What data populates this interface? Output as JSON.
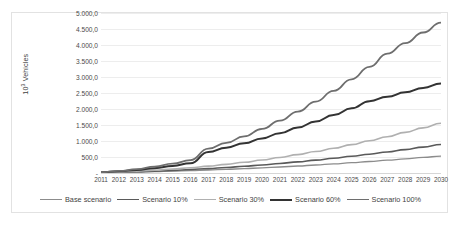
{
  "chart_data": {
    "type": "line",
    "title": "",
    "xlabel": "",
    "ylabel": "10³ Vehicles",
    "ylabel_html": "10<sup>3</sup> Vehicles",
    "x": [
      2011,
      2012,
      2013,
      2014,
      2015,
      2016,
      2017,
      2018,
      2019,
      2020,
      2021,
      2022,
      2023,
      2024,
      2025,
      2026,
      2027,
      2028,
      2029,
      2030
    ],
    "categories": [
      "2011",
      "2012",
      "2013",
      "2014",
      "2015",
      "2016",
      "2017",
      "2018",
      "2019",
      "2020",
      "2021",
      "2022",
      "2023",
      "2024",
      "2025",
      "2026",
      "2027",
      "2028",
      "2029",
      "2030"
    ],
    "ylim": [
      0,
      5000
    ],
    "ytick_values": [
      0,
      500,
      1000,
      1500,
      2000,
      2500,
      3000,
      3500,
      4000,
      4500,
      5000
    ],
    "ytick_labels": [
      "-",
      "500,0",
      "1.000,0",
      "1.500,0",
      "2.000,0",
      "2.500,0",
      "3.000,0",
      "3.500,0",
      "4.000,0",
      "4.500,0",
      "5.000,0"
    ],
    "grid": true,
    "legend_position": "bottom",
    "series": [
      {
        "name": "Base scenario",
        "color": "#8c8c8c",
        "width": 1.3,
        "values": [
          10,
          20,
          32,
          45,
          60,
          76,
          94,
          114,
          136,
          160,
          188,
          218,
          250,
          285,
          322,
          360,
          400,
          442,
          486,
          530
        ]
      },
      {
        "name": "Scenario 10%",
        "color": "#5a5a5a",
        "width": 1.6,
        "values": [
          12,
          26,
          42,
          60,
          82,
          108,
          138,
          172,
          210,
          252,
          298,
          348,
          402,
          460,
          522,
          588,
          658,
          732,
          810,
          892
        ]
      },
      {
        "name": "Scenario 30%",
        "color": "#b0b0b0",
        "width": 1.6,
        "values": [
          15,
          34,
          58,
          88,
          124,
          166,
          214,
          270,
          334,
          406,
          486,
          574,
          670,
          774,
          886,
          1006,
          1134,
          1270,
          1410,
          1555
        ]
      },
      {
        "name": "Scenario 60%",
        "color": "#333333",
        "width": 2.0,
        "values": [
          20,
          52,
          96,
          152,
          222,
          306,
          660,
          790,
          930,
          1082,
          1246,
          1422,
          1610,
          1810,
          2022,
          2246,
          2382,
          2520,
          2660,
          2800
        ]
      },
      {
        "name": "Scenario 100%",
        "color": "#6e6e6e",
        "width": 1.8,
        "values": [
          24,
          64,
          122,
          198,
          292,
          404,
          760,
          940,
          1146,
          1378,
          1636,
          1920,
          2230,
          2566,
          2928,
          3316,
          3730,
          4060,
          4390,
          4700
        ]
      }
    ]
  },
  "legend": {
    "items": [
      {
        "label": "Base scenario"
      },
      {
        "label": "Scenario 10%"
      },
      {
        "label": "Scenario 30%"
      },
      {
        "label": "Scenario 60%"
      },
      {
        "label": "Scenario 100%"
      }
    ]
  }
}
